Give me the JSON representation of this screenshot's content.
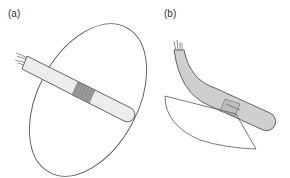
{
  "panels": [
    {
      "id": "a",
      "label": "(a)",
      "description": "Straight probe with wound coil passing through an elliptical plane"
    },
    {
      "id": "b",
      "label": "(b)",
      "description": "Curved probe with small rectangular coil intersecting a curved wedge-shaped plane"
    }
  ],
  "colors": {
    "outline": "#555555",
    "probe_fill_a": "#ececec",
    "probe_fill_b": "#cfcfcf",
    "coil_fill": "#9a9a9a",
    "wire": "#666666"
  }
}
